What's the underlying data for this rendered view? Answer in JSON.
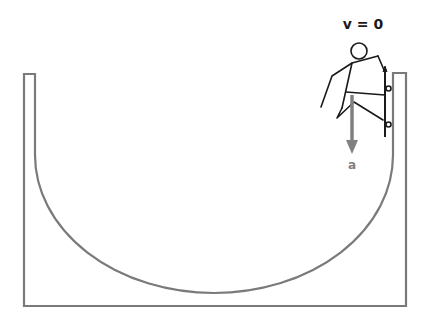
{
  "diagram": {
    "velocity_label": "v = 0",
    "acceleration_label": "a",
    "colors": {
      "ramp": "#7a7a7a",
      "figure": "#1a1a1a",
      "arrow": "#808080",
      "label_v": "#1a1a1a",
      "label_a": "#808080"
    }
  }
}
